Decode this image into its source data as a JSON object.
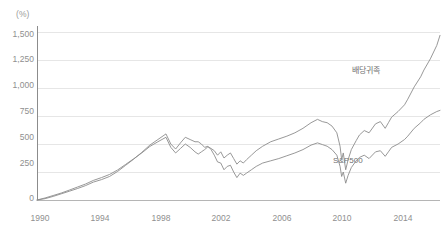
{
  "chart_data": {
    "type": "line",
    "title": "",
    "subtitle": "",
    "xlabel": "",
    "ylabel": "",
    "unit_label": "(%)",
    "grid": true,
    "grid_axis": "y",
    "legend_position": "inline-annotation",
    "xlim": [
      1990,
      2015
    ],
    "ylim": [
      0,
      1500
    ],
    "yticks": [
      0,
      250,
      500,
      750,
      1000,
      1250,
      1500
    ],
    "ytick_labels": [
      "0",
      "250",
      "500",
      "750",
      "1,000",
      "1,250",
      "1,500"
    ],
    "xticks": [
      1990,
      1994,
      1998,
      2002,
      2006,
      2010,
      2014
    ],
    "xtick_labels": [
      "1990",
      "1994",
      "1998",
      "2002",
      "2006",
      "2010",
      "2014"
    ],
    "x": [
      1990.0,
      1990.5,
      1991.0,
      1991.5,
      1992.0,
      1992.5,
      1993.0,
      1993.5,
      1994.0,
      1994.5,
      1995.0,
      1995.5,
      1996.0,
      1996.5,
      1997.0,
      1997.5,
      1998.0,
      1998.3,
      1998.6,
      1998.9,
      1999.2,
      1999.5,
      1999.8,
      2000.0,
      2000.2,
      2000.4,
      2000.6,
      2000.8,
      2001.0,
      2001.2,
      2001.4,
      2001.6,
      2001.8,
      2002.0,
      2002.2,
      2002.4,
      2002.6,
      2002.8,
      2003.0,
      2003.3,
      2003.6,
      2004.0,
      2004.5,
      2005.0,
      2005.5,
      2006.0,
      2006.5,
      2007.0,
      2007.4,
      2007.7,
      2008.0,
      2008.3,
      2008.6,
      2008.8,
      2008.9,
      2009.0,
      2009.15,
      2009.3,
      2009.5,
      2009.8,
      2010.0,
      2010.3,
      2010.6,
      2011.0,
      2011.3,
      2011.6,
      2011.8,
      2012.0,
      2012.4,
      2012.8,
      2013.0,
      2013.4,
      2013.8,
      2014.0,
      2014.4,
      2014.8,
      2015.0
    ],
    "series": [
      {
        "name": "배당귀족",
        "label": "배당귀족",
        "color": "#8c8c8c",
        "values": [
          0,
          18,
          40,
          62,
          88,
          115,
          142,
          175,
          200,
          228,
          268,
          318,
          368,
          420,
          478,
          520,
          560,
          470,
          420,
          460,
          500,
          470,
          430,
          410,
          430,
          450,
          475,
          460,
          440,
          400,
          430,
          375,
          400,
          420,
          370,
          320,
          350,
          330,
          360,
          400,
          440,
          480,
          520,
          545,
          570,
          600,
          640,
          690,
          720,
          700,
          690,
          660,
          600,
          480,
          360,
          420,
          270,
          360,
          450,
          530,
          580,
          620,
          600,
          680,
          700,
          640,
          690,
          740,
          790,
          850,
          900,
          1010,
          1100,
          1160,
          1260,
          1380,
          1470
        ]
      },
      {
        "name": "S&P500",
        "label": "S&P500",
        "color": "#8c8c8c",
        "values": [
          0,
          12,
          32,
          55,
          78,
          102,
          128,
          160,
          182,
          210,
          255,
          310,
          365,
          425,
          490,
          540,
          590,
          500,
          455,
          510,
          560,
          540,
          520,
          520,
          500,
          470,
          480,
          450,
          400,
          340,
          330,
          270,
          300,
          310,
          250,
          200,
          240,
          220,
          240,
          270,
          300,
          330,
          350,
          370,
          395,
          420,
          450,
          490,
          510,
          495,
          480,
          450,
          400,
          300,
          210,
          250,
          150,
          220,
          290,
          350,
          380,
          400,
          370,
          430,
          440,
          390,
          430,
          470,
          500,
          540,
          570,
          640,
          690,
          720,
          760,
          790,
          800
        ]
      }
    ],
    "annotations": [
      {
        "text": "배당귀족",
        "x": 2011.0,
        "y": 1130
      },
      {
        "text": "S&P500",
        "x": 2009.4,
        "y": 330
      }
    ],
    "colors": {
      "background": "#ffffff",
      "grid": "#e6e6e6",
      "axis": "#8c8c8c",
      "line": "#8c8c8c",
      "tick_text": "#8f8f8f",
      "annotation_text": "#6f6f6f"
    }
  }
}
